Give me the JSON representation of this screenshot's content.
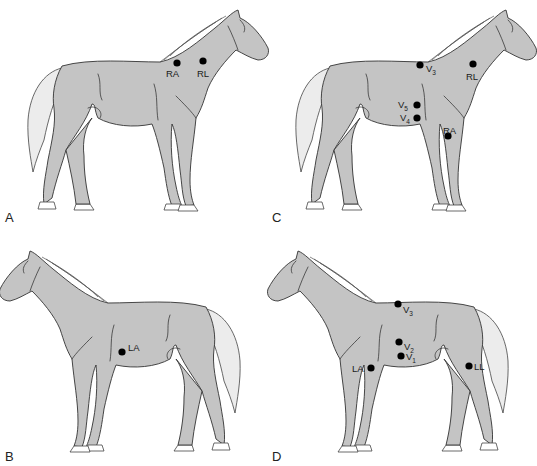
{
  "figure": {
    "panels": [
      {
        "id": "A",
        "letter": "A",
        "facing": "right",
        "electrodes": [
          {
            "label": "RA",
            "sub": "",
            "x": 177,
            "y": 63,
            "lx": 166,
            "ly": 77
          },
          {
            "label": "RL",
            "sub": "",
            "x": 203,
            "y": 61,
            "lx": 197,
            "ly": 77
          }
        ]
      },
      {
        "id": "C",
        "letter": "C",
        "facing": "right",
        "electrodes": [
          {
            "label": "V",
            "sub": "3",
            "x": 420,
            "y": 65,
            "lx": 426,
            "ly": 72
          },
          {
            "label": "RL",
            "sub": "",
            "x": 473,
            "y": 64,
            "lx": 466,
            "ly": 80
          },
          {
            "label": "V",
            "sub": "5",
            "x": 417,
            "y": 105,
            "lx": 398,
            "ly": 108
          },
          {
            "label": "V",
            "sub": "4",
            "x": 417,
            "y": 118,
            "lx": 400,
            "ly": 121
          },
          {
            "label": "RA",
            "sub": "",
            "x": 448,
            "y": 136,
            "lx": 443,
            "ly": 134
          }
        ]
      },
      {
        "id": "B",
        "letter": "B",
        "facing": "left",
        "electrodes": [
          {
            "label": "LA",
            "sub": "",
            "x": 122,
            "y": 352,
            "lx": 128,
            "ly": 351
          }
        ]
      },
      {
        "id": "D",
        "letter": "D",
        "facing": "left",
        "electrodes": [
          {
            "label": "V",
            "sub": "3",
            "x": 398,
            "y": 304,
            "lx": 403,
            "ly": 313
          },
          {
            "label": "V",
            "sub": "2",
            "x": 399,
            "y": 342,
            "lx": 404,
            "ly": 350
          },
          {
            "label": "V",
            "sub": "1",
            "x": 401,
            "y": 356,
            "lx": 406,
            "ly": 360
          },
          {
            "label": "LA",
            "sub": "",
            "x": 371,
            "y": 368,
            "lx": 352,
            "ly": 372
          },
          {
            "label": "LL",
            "sub": "",
            "x": 469,
            "y": 366,
            "lx": 474,
            "ly": 370
          }
        ]
      }
    ]
  }
}
